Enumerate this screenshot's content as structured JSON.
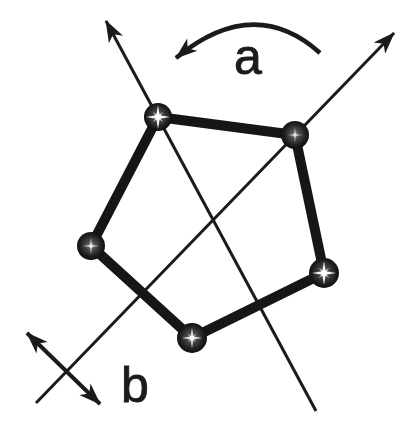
{
  "diagram": {
    "background_color": "#ffffff",
    "ink_color": "#1b1b1b",
    "atom_count": 5,
    "labels": {
      "rotation": "a",
      "axis": "b"
    }
  }
}
